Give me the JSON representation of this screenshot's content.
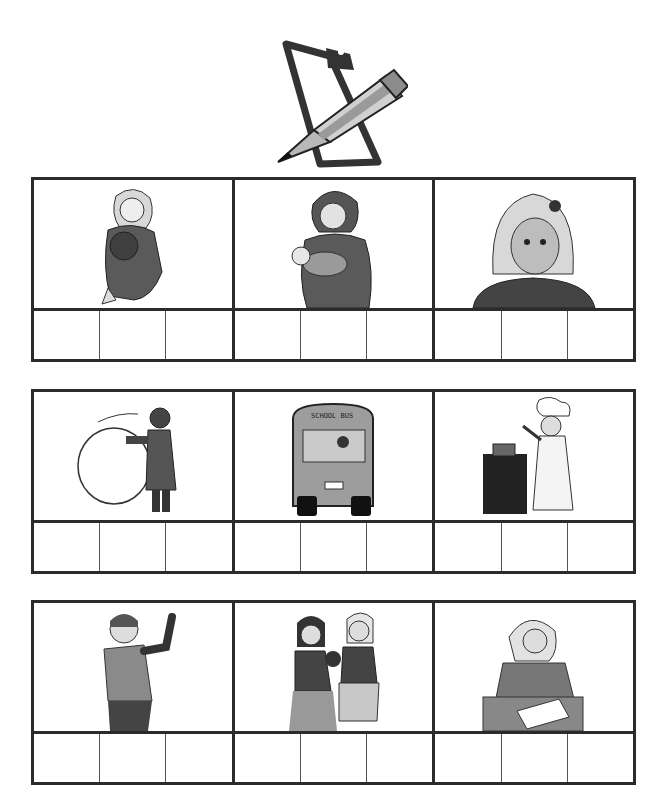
{
  "worksheet": {
    "header_icon": "clipboard-pencil-icon",
    "rows": [
      {
        "pictures": [
          {
            "name": "girl-hugging-teddy-bear",
            "label": ""
          },
          {
            "name": "mother-holding-baby",
            "label": ""
          },
          {
            "name": "crying-girl",
            "label": ""
          }
        ],
        "boxes_per_picture": 3
      },
      {
        "pictures": [
          {
            "name": "child-rolling-snowball",
            "label": ""
          },
          {
            "name": "school-bus",
            "label": "SCHOOL BUS"
          },
          {
            "name": "girl-chef-cooking",
            "label": ""
          }
        ],
        "boxes_per_picture": 3
      },
      {
        "pictures": [
          {
            "name": "boy-flexing-muscle",
            "label": ""
          },
          {
            "name": "girls-fighting-over-teddy",
            "label": ""
          },
          {
            "name": "girl-writing-at-desk",
            "label": ""
          }
        ],
        "boxes_per_picture": 3
      }
    ]
  },
  "colors": {
    "grid_line": "#2b2b2b",
    "figure_dark": "#4a4a4a",
    "figure_mid": "#8a8a8a",
    "figure_light": "#cfcfcf",
    "background": "#ffffff"
  }
}
